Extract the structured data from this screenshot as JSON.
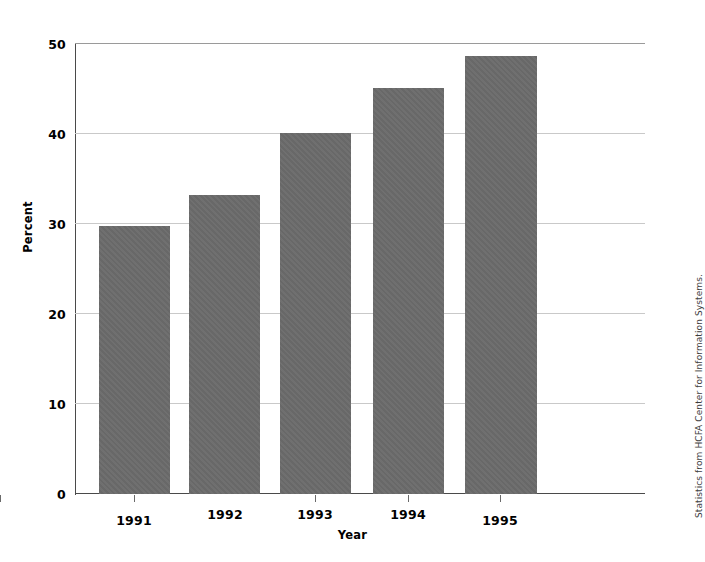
{
  "chart_data": {
    "type": "bar",
    "title": "",
    "subtitle": "",
    "xlabel": "Year",
    "ylabel": "Percent",
    "categories": [
      "1991",
      "1992",
      "1993",
      "1994",
      "1995"
    ],
    "values": [
      29.7,
      33.1,
      40.0,
      45.0,
      48.6
    ],
    "series": [
      {
        "name": "Percent",
        "values": [
          29.7,
          33.1,
          40.0,
          45.0,
          48.6
        ]
      }
    ],
    "ylim": [
      0,
      50
    ],
    "yticks": [
      0,
      10,
      20,
      30,
      40,
      50
    ],
    "ytick_labels": [
      "0",
      "10",
      "20",
      "30",
      "40",
      "50"
    ],
    "xtick_labels": [
      "1991",
      "1992",
      "1993",
      "1994",
      "1995"
    ],
    "grid": true,
    "grid_axis": "y",
    "legend": false,
    "legend_position": "none",
    "bar_color": "#6b6b6b",
    "grid_color": "#c9c9c9",
    "axis_color": "#4a4a4a",
    "annotations": [
      {
        "name": "source-credit",
        "text": "Statistics from HCFA Center for Information Systems.",
        "position": "right-edge-vertical"
      }
    ]
  },
  "axes": {
    "y": {
      "title": "Percent",
      "ticks": [
        {
          "label": "50",
          "value": 50
        },
        {
          "label": "40",
          "value": 40
        },
        {
          "label": "30",
          "value": 30
        },
        {
          "label": "20",
          "value": 20
        },
        {
          "label": "10",
          "value": 10
        },
        {
          "label": "0",
          "value": 0
        }
      ]
    },
    "x": {
      "title": "Year",
      "ticks": [
        {
          "label": "1991"
        },
        {
          "label": "1992"
        },
        {
          "label": "1993"
        },
        {
          "label": "1994"
        },
        {
          "label": "1995"
        }
      ]
    }
  },
  "credit": {
    "text": "Statistics from HCFA Center for Information Systems."
  }
}
